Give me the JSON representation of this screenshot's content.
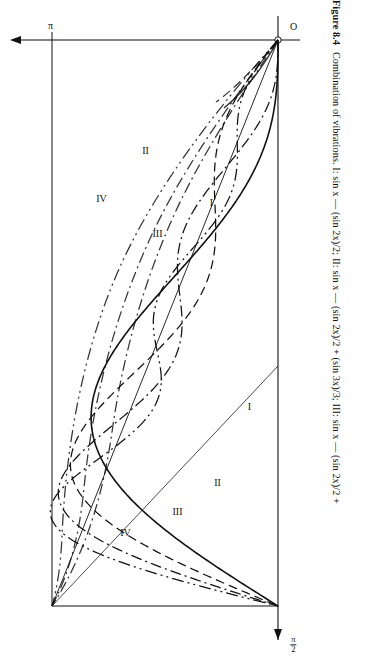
{
  "figure": {
    "number": "Figure 8.4",
    "caption": "Combination of vibrations.  I: sin x — (sin 2x)/2;  II: sin x — (sin 2x)/2 + (sin 3x)/3;  III: sin x — (sin 2x)/2 +"
  },
  "axes": {
    "origin_label": "O",
    "x_end_label": "π",
    "y_tick_numerator": "π",
    "y_tick_denominator": "2",
    "x_range": [
      0,
      3.14159265
    ],
    "y_range": [
      0,
      1.5708
    ]
  },
  "curve_labels": {
    "I": "I",
    "II": "II",
    "III": "III",
    "IV": "IV"
  },
  "chart_data": {
    "type": "line",
    "title": "Combination of vibrations",
    "xlabel": "x",
    "ylabel": "y",
    "xlim": [
      0,
      3.14159265
    ],
    "ylim": [
      0,
      1.5708
    ],
    "grid": false,
    "legend": "inline-labels",
    "series": [
      {
        "name": "I",
        "label": "I",
        "expression": "sin x — (sin 2x)/2",
        "style": "solid",
        "harmonics": [
          1,
          -0.5
        ]
      },
      {
        "name": "II",
        "label": "II",
        "expression": "sin x — (sin 2x)/2 + (sin 3x)/3",
        "style": "dashed",
        "harmonics": [
          1,
          -0.5,
          0.3333333
        ]
      },
      {
        "name": "III",
        "label": "III",
        "expression": "sin x — (sin 2x)/2 + (sin 3x)/3 — (sin 4x)/4",
        "style": "dash-dot",
        "harmonics": [
          1,
          -0.5,
          0.3333333,
          -0.25
        ]
      },
      {
        "name": "IV",
        "label": "IV",
        "expression": "sin x — (sin 2x)/2 + (sin 3x)/3 — (sin 4x)/4 + (sin 5x)/5",
        "style": "dash-dot-dot",
        "harmonics": [
          1,
          -0.5,
          0.3333333,
          -0.25,
          0.2
        ]
      },
      {
        "name": "limit",
        "label": "",
        "expression": "x/2",
        "style": "solid-thin",
        "linear": true
      }
    ]
  },
  "colors": {
    "ink": "#111111",
    "paper": "#ffffff"
  }
}
